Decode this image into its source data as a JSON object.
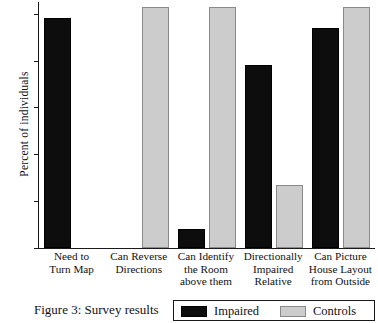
{
  "figure": {
    "caption": "Figure 3: Survey results"
  },
  "chart_data": {
    "type": "bar",
    "title": "",
    "xlabel": "",
    "ylabel": "Percent of individuals",
    "ylim": [
      0,
      105
    ],
    "yticks": [
      0,
      20,
      40,
      60,
      80,
      100
    ],
    "ytick_labels": [
      "0",
      "20",
      "40",
      "60",
      "80",
      "100"
    ],
    "grid": false,
    "legend_position": "bottom-right",
    "categories": [
      "Need to\nTurn Map",
      "Can Reverse\nDirections",
      "Can Identify\nthe Room\nabove them",
      "Directionally\nImpaired\nRelative",
      "Can Picture\nHouse Layout\nfrom Outside"
    ],
    "series": [
      {
        "name": "Impaired",
        "color": "#0d0d0d",
        "values": [
          98,
          null,
          8,
          78,
          94
        ]
      },
      {
        "name": "Controls",
        "color": "#cccccc",
        "values": [
          null,
          103,
          103,
          27,
          103
        ]
      }
    ]
  },
  "legend": {
    "entries": [
      {
        "label": "Impaired",
        "swatch": "impaired"
      },
      {
        "label": "Controls",
        "swatch": "controls"
      }
    ]
  }
}
